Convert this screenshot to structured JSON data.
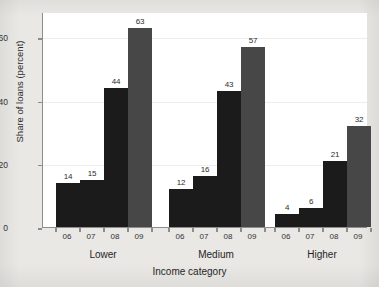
{
  "chart_data": {
    "type": "bar",
    "title": "",
    "xlabel": "Income category",
    "ylabel": "Share of loans (percent)",
    "ylim": [
      0,
      68
    ],
    "yticks": [
      0,
      20,
      40,
      60
    ],
    "grid": true,
    "legend": "none",
    "categories": [
      "Lower",
      "Medium",
      "Higher"
    ],
    "x": [
      "06",
      "07",
      "08",
      "09"
    ],
    "series": [
      {
        "name": "06",
        "values": [
          14,
          12,
          4
        ],
        "color": "#1b1b1b"
      },
      {
        "name": "07",
        "values": [
          15,
          16,
          6
        ],
        "color": "#1b1b1b"
      },
      {
        "name": "08",
        "values": [
          44,
          43,
          21
        ],
        "color": "#1b1b1b"
      },
      {
        "name": "09",
        "values": [
          63,
          57,
          32
        ],
        "color": "#474747"
      }
    ],
    "groups": [
      {
        "label": "Lower",
        "bars": [
          {
            "x": "06",
            "value": 14,
            "label": "14",
            "color": "#1b1b1b"
          },
          {
            "x": "07",
            "value": 15,
            "label": "15",
            "color": "#1b1b1b"
          },
          {
            "x": "08",
            "value": 44,
            "label": "44",
            "color": "#1b1b1b"
          },
          {
            "x": "09",
            "value": 63,
            "label": "63",
            "color": "#474747"
          }
        ]
      },
      {
        "label": "Medium",
        "bars": [
          {
            "x": "06",
            "value": 12,
            "label": "12",
            "color": "#1b1b1b"
          },
          {
            "x": "07",
            "value": 16,
            "label": "16",
            "color": "#1b1b1b"
          },
          {
            "x": "08",
            "value": 43,
            "label": "43",
            "color": "#1b1b1b"
          },
          {
            "x": "09",
            "value": 57,
            "label": "57",
            "color": "#474747"
          }
        ]
      },
      {
        "label": "Higher",
        "bars": [
          {
            "x": "06",
            "value": 4,
            "label": "4",
            "color": "#1b1b1b"
          },
          {
            "x": "07",
            "value": 6,
            "label": "6",
            "color": "#1b1b1b"
          },
          {
            "x": "08",
            "value": 21,
            "label": "21",
            "color": "#1b1b1b"
          },
          {
            "x": "09",
            "value": 32,
            "label": "32",
            "color": "#474747"
          }
        ]
      }
    ]
  },
  "axis": {
    "y_tick_labels": [
      "0",
      "20",
      "40",
      "60"
    ],
    "y_title": "Share of loans (percent)",
    "x_title": "Income category"
  },
  "colors": {
    "page_background": "#e9e8e5",
    "plot_background": "#ffffff",
    "axis_line": "#8d8d8d",
    "gridline": "#ededed",
    "bar_dark": "#1b1b1b",
    "bar_grey": "#474747",
    "text": "#2a2a2a"
  }
}
